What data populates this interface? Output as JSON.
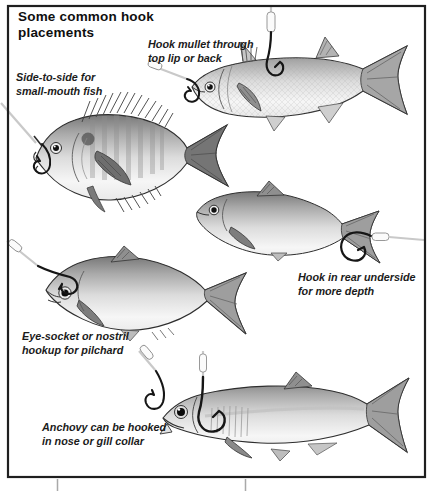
{
  "figure": {
    "title": "Some common hook\nplacements",
    "annotations": {
      "mullet": {
        "text": "Hook mullet through\ntop lip or back"
      },
      "smallmouth": {
        "text": "Side-to-side for\nsmall-mouth fish"
      },
      "rear": {
        "text": "Hook in rear underside\nfor more depth"
      },
      "pilchard": {
        "text": "Eye-socket or nostril\nhookup for pilchard"
      },
      "anchovy": {
        "text": "Anchovy can be hooked\nin nose or gill collar"
      }
    },
    "fish": [
      {
        "id": "mullet",
        "hooks": [
          "top-lip-hook",
          "back-hook"
        ]
      },
      {
        "id": "small-mouth-fish",
        "hooks": [
          "side-to-side-mouth-hook"
        ]
      },
      {
        "id": "baitfish",
        "hooks": [
          "rear-underside-hook"
        ]
      },
      {
        "id": "pilchard",
        "hooks": [
          "eye-socket-hook"
        ]
      },
      {
        "id": "anchovy",
        "hooks": [
          "nose-hook",
          "gill-collar-hook"
        ]
      }
    ],
    "colors": {
      "background": "#ffffff",
      "frame": "#1f1f1f",
      "text": "#1b1b1b",
      "fishing_line": "#c9c9c9",
      "leader_sleeve": "#fbfbfb",
      "hook": "#161616",
      "fish_back": "#7c7c7c",
      "fish_belly": "#f6f6f6",
      "fin": "#8f8f8f",
      "crop_mark": "#a9a9a9"
    }
  }
}
